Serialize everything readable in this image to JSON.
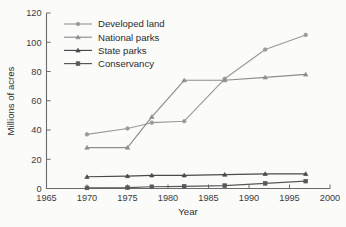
{
  "chart_data": {
    "type": "line",
    "title": "",
    "xlabel": "Year",
    "ylabel": "Millions of acres",
    "xlim": [
      1965,
      2000
    ],
    "ylim": [
      0,
      120
    ],
    "xticks": [
      1965,
      1970,
      1975,
      1980,
      1985,
      1990,
      1995,
      2000
    ],
    "yticks": [
      0,
      20,
      40,
      60,
      80,
      100,
      120
    ],
    "grid": false,
    "legend_position": "top-left-inside",
    "series": [
      {
        "name": "Developed land",
        "color": "#9a9a9a",
        "marker": "circle",
        "x": [
          1970,
          1975,
          1978,
          1982,
          1987,
          1992,
          1997
        ],
        "values": [
          37,
          41,
          45,
          46,
          75,
          95,
          105
        ]
      },
      {
        "name": "National parks",
        "color": "#8d8d8d",
        "marker": "triangle",
        "x": [
          1970,
          1975,
          1978,
          1982,
          1987,
          1992,
          1997
        ],
        "values": [
          28,
          28,
          49,
          74,
          74,
          76,
          78
        ]
      },
      {
        "name": "State parks",
        "color": "#4a4a4a",
        "marker": "triangle",
        "x": [
          1970,
          1975,
          1978,
          1982,
          1987,
          1992,
          1997
        ],
        "values": [
          8,
          8.5,
          9,
          9,
          9.5,
          10,
          10
        ]
      },
      {
        "name": "Conservancy",
        "color": "#585858",
        "marker": "square",
        "x": [
          1970,
          1975,
          1978,
          1982,
          1987,
          1992,
          1997
        ],
        "values": [
          0.4,
          0.6,
          1.2,
          1.5,
          2.0,
          3.5,
          5.0
        ]
      }
    ]
  },
  "axes": {
    "y_title": "Millions of acres",
    "x_title": "Year",
    "y_tick_labels": [
      "0",
      "20",
      "40",
      "60",
      "80",
      "100",
      "120"
    ],
    "x_tick_labels": [
      "1965",
      "1970",
      "1975",
      "1980",
      "1985",
      "1990",
      "1995",
      "2000"
    ]
  },
  "legend": {
    "entries": [
      {
        "label": "Developed land",
        "marker": "circle-marker",
        "color": "#9a9a9a"
      },
      {
        "label": "National parks",
        "marker": "triangle-marker",
        "color": "#8d8d8d"
      },
      {
        "label": "State parks",
        "marker": "triangle-marker",
        "color": "#4a4a4a"
      },
      {
        "label": "Conservancy",
        "marker": "square-marker",
        "color": "#585858"
      }
    ]
  }
}
